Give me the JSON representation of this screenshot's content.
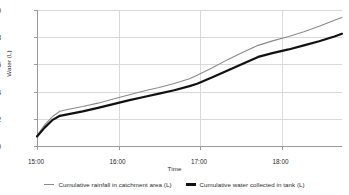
{
  "chart_data": {
    "type": "line",
    "title": "",
    "xlabel": "Time",
    "ylabel": "Water (L)",
    "xtick_labels": [
      "15:00",
      "16:00",
      "17:00",
      "18:00"
    ],
    "ytick_labels": [
      "0",
      "2",
      "4",
      "6",
      "8",
      "10"
    ],
    "ylim": [
      0,
      10
    ],
    "xlim": [
      "15:00",
      "18:20"
    ],
    "grid": true,
    "legend_position": "bottom",
    "x": [
      "15:00",
      "15:05",
      "15:10",
      "15:15",
      "15:20",
      "15:30",
      "15:40",
      "15:50",
      "16:00",
      "16:10",
      "16:20",
      "16:30",
      "16:40",
      "16:45",
      "16:55",
      "17:05",
      "17:15",
      "17:25",
      "17:35",
      "17:45",
      "17:55",
      "18:05",
      "18:15",
      "18:20"
    ],
    "series": [
      {
        "name": "Cumulative rainfall in catchment area (L)",
        "color": "#8a8a8a",
        "line_width": 1.1,
        "values": [
          0.75,
          1.55,
          2.15,
          2.55,
          2.68,
          2.9,
          3.15,
          3.45,
          3.75,
          4.05,
          4.3,
          4.6,
          4.95,
          5.2,
          5.75,
          6.35,
          6.9,
          7.4,
          7.75,
          8.05,
          8.4,
          8.8,
          9.25,
          9.45
        ]
      },
      {
        "name": "Cumulative water collected in tank (L)",
        "color": "#111111",
        "line_width": 2.2,
        "values": [
          0.7,
          1.35,
          1.9,
          2.22,
          2.33,
          2.55,
          2.8,
          3.08,
          3.35,
          3.6,
          3.85,
          4.1,
          4.4,
          4.58,
          5.05,
          5.55,
          6.05,
          6.55,
          6.85,
          7.1,
          7.4,
          7.7,
          8.05,
          8.25
        ]
      }
    ]
  }
}
